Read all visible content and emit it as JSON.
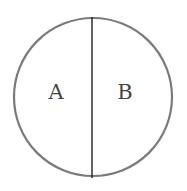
{
  "diagram": {
    "type": "circle-divided",
    "regions": [
      {
        "label": "A",
        "side": "left"
      },
      {
        "label": "B",
        "side": "right"
      }
    ],
    "colors": {
      "outline": "#7a7a7a",
      "divider": "#222222",
      "label": "#444444",
      "background": "#ffffff"
    }
  }
}
